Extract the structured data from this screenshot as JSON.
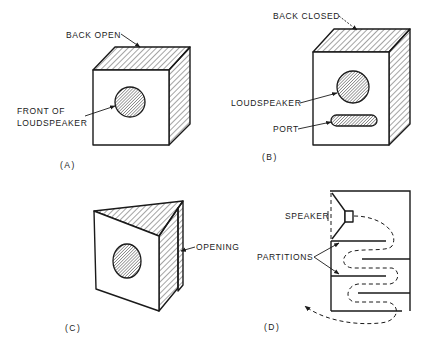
{
  "figure": {
    "panels": [
      {
        "id": "A",
        "caption": "(A)",
        "labels": {
          "back": "BACK OPEN",
          "front_line1": "FRONT OF",
          "front_line2": "LOUDSPEAKER"
        }
      },
      {
        "id": "B",
        "caption": "(B)",
        "labels": {
          "back": "BACK CLOSED",
          "speaker": "LOUDSPEAKER",
          "port": "PORT"
        }
      },
      {
        "id": "C",
        "caption": "(C)",
        "labels": {
          "opening": "OPENING"
        }
      },
      {
        "id": "D",
        "caption": "(D)",
        "labels": {
          "speaker": "SPEAKER",
          "partitions": "PARTITIONS"
        }
      }
    ]
  },
  "colors": {
    "ink": "#1a1a1a",
    "background": "#ffffff"
  }
}
